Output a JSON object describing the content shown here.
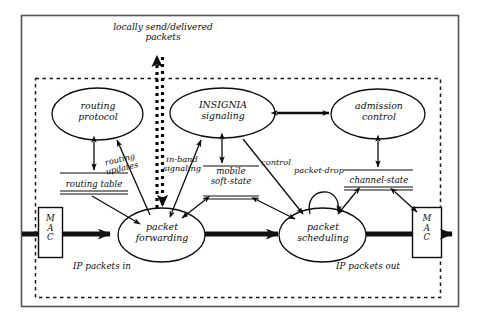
{
  "figure": {
    "colors": {
      "ink": "#0d0d0d",
      "background": "#ffffff",
      "flow_arrow": "#111111",
      "dashed_boundary": "#1a1a1a"
    },
    "outer_frame": {
      "style": "solid",
      "label": ""
    },
    "inner_boundary": {
      "style": "dashed",
      "label": ""
    }
  },
  "nodes": {
    "routing_protocol": {
      "label": "routing\nprotocol",
      "shape": "ellipse"
    },
    "insignia_signaling": {
      "label": "INSIGNIA\nsignaling",
      "shape": "ellipse"
    },
    "admission_control": {
      "label": "admission\ncontrol",
      "shape": "ellipse"
    },
    "packet_forwarding": {
      "label": "packet\nforwarding",
      "shape": "ellipse"
    },
    "packet_scheduling": {
      "label": "packet\nscheduling",
      "shape": "ellipse"
    }
  },
  "stores": {
    "routing_table": {
      "label": "routing table",
      "style": "double-underline"
    },
    "mobile_soft_state": {
      "label": "mobile\nsoft-state",
      "style": "double-underline"
    },
    "channel_state": {
      "label": "channel-state",
      "style": "double-underline"
    }
  },
  "mac_blocks": {
    "left": {
      "label": "M\nA\nC"
    },
    "right": {
      "label": "M\nA\nC"
    }
  },
  "edge_labels": {
    "routing_updates": "routing\nupdates",
    "in_band_signaling": "in-band\nsignaling",
    "control": "control",
    "packet_drop": "packet-drop",
    "locally_send_delivered": "locally send/delivered\npackets"
  },
  "io_labels": {
    "packets_in": "IP packets in",
    "packets_out": "IP packets out"
  }
}
